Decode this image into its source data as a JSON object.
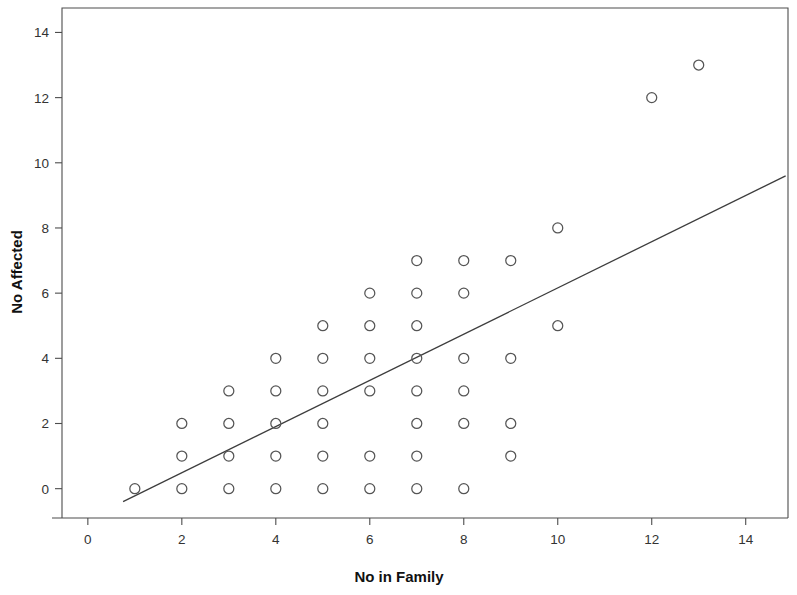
{
  "chart_data": {
    "type": "scatter",
    "title": "",
    "subtitle": "",
    "xlabel": "No in Family",
    "ylabel": "No Affected",
    "xlim": [
      -0.55,
      14.9
    ],
    "ylim": [
      -0.9,
      14.75
    ],
    "xticks": [
      0,
      2,
      4,
      6,
      8,
      10,
      12,
      14
    ],
    "xtick_labels": [
      "0",
      "2",
      "4",
      "6",
      "8",
      "10",
      "12",
      "14"
    ],
    "yticks": [
      0,
      2,
      4,
      6,
      8,
      10,
      12,
      14
    ],
    "ytick_labels": [
      "0",
      "2",
      "4",
      "6",
      "8",
      "10",
      "12",
      "14"
    ],
    "grid": false,
    "legend": null,
    "marker": "open-circle",
    "marker_color": "#555555",
    "points": [
      {
        "x": 1,
        "y": 0
      },
      {
        "x": 2,
        "y": 0
      },
      {
        "x": 2,
        "y": 1
      },
      {
        "x": 2,
        "y": 2
      },
      {
        "x": 3,
        "y": 0
      },
      {
        "x": 3,
        "y": 1
      },
      {
        "x": 3,
        "y": 2
      },
      {
        "x": 3,
        "y": 3
      },
      {
        "x": 4,
        "y": 0
      },
      {
        "x": 4,
        "y": 1
      },
      {
        "x": 4,
        "y": 2
      },
      {
        "x": 4,
        "y": 3
      },
      {
        "x": 4,
        "y": 4
      },
      {
        "x": 5,
        "y": 0
      },
      {
        "x": 5,
        "y": 1
      },
      {
        "x": 5,
        "y": 2
      },
      {
        "x": 5,
        "y": 3
      },
      {
        "x": 5,
        "y": 4
      },
      {
        "x": 5,
        "y": 5
      },
      {
        "x": 6,
        "y": 0
      },
      {
        "x": 6,
        "y": 1
      },
      {
        "x": 6,
        "y": 3
      },
      {
        "x": 6,
        "y": 4
      },
      {
        "x": 6,
        "y": 5
      },
      {
        "x": 6,
        "y": 6
      },
      {
        "x": 7,
        "y": 0
      },
      {
        "x": 7,
        "y": 1
      },
      {
        "x": 7,
        "y": 2
      },
      {
        "x": 7,
        "y": 3
      },
      {
        "x": 7,
        "y": 4
      },
      {
        "x": 7,
        "y": 5
      },
      {
        "x": 7,
        "y": 6
      },
      {
        "x": 7,
        "y": 7
      },
      {
        "x": 8,
        "y": 0
      },
      {
        "x": 8,
        "y": 2
      },
      {
        "x": 8,
        "y": 3
      },
      {
        "x": 8,
        "y": 4
      },
      {
        "x": 8,
        "y": 6
      },
      {
        "x": 8,
        "y": 7
      },
      {
        "x": 9,
        "y": 1
      },
      {
        "x": 9,
        "y": 2
      },
      {
        "x": 9,
        "y": 4
      },
      {
        "x": 9,
        "y": 7
      },
      {
        "x": 10,
        "y": 5
      },
      {
        "x": 10,
        "y": 8
      },
      {
        "x": 12,
        "y": 12
      },
      {
        "x": 13,
        "y": 13
      }
    ],
    "fit_line": {
      "label": "linear fit",
      "x_start": 0.75,
      "y_start": -0.4,
      "x_end": 14.85,
      "y_end": 9.6,
      "color": "#3d3d3d"
    }
  }
}
